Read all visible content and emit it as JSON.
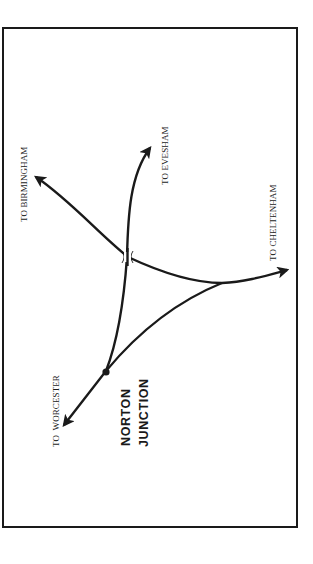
{
  "diagram": {
    "title_lines": [
      "NORTON",
      "JUNCTION"
    ],
    "destinations": {
      "birmingham": "TO BIRMINGHAM",
      "evesham": "TO EVESHAM",
      "cheltenham": "TO CHELTENHAM",
      "worcester": "TO  WORCESTER"
    },
    "colors": {
      "line": "#1a1a1a",
      "background": "#ffffff"
    }
  }
}
